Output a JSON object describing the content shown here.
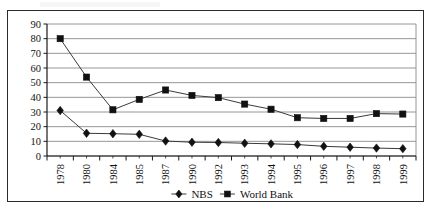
{
  "chart_data": {
    "type": "line",
    "title": "",
    "subtitle": "",
    "xlabel": "",
    "ylabel": "",
    "categories": [
      "1978",
      "1980",
      "1984",
      "1985",
      "1987",
      "1990",
      "1992",
      "1993",
      "1994",
      "1995",
      "1996",
      "1997",
      "1998",
      "1999"
    ],
    "series": [
      {
        "name": "NBS",
        "marker": "diamond",
        "color": "#000000",
        "values": [
          31,
          15.5,
          15.2,
          14.8,
          10.2,
          9.4,
          9.2,
          8.7,
          8.3,
          7.8,
          6.6,
          6.0,
          5.4,
          5.0
        ]
      },
      {
        "name": "World Bank",
        "marker": "square",
        "color": "#000000",
        "values": [
          80,
          53.8,
          31.5,
          38.6,
          45,
          41.3,
          39.8,
          35.4,
          31.9,
          26.1,
          25.6,
          25.6,
          28.9,
          28.6
        ]
      }
    ],
    "ylim": [
      0,
      90
    ],
    "ytick_step": 10,
    "yticks": [
      "0",
      "10",
      "20",
      "30",
      "40",
      "50",
      "60",
      "70",
      "80",
      "90"
    ],
    "grid": "horizontal",
    "legend_position": "bottom",
    "legend": [
      {
        "label": "NBS",
        "marker": "diamond"
      },
      {
        "label": "World Bank",
        "marker": "square"
      }
    ]
  },
  "style": {
    "grid_color": "#8a8a8a",
    "axis_color": "#1a1a1a",
    "line_color": "#3a3a3a",
    "marker_color": "#111111",
    "frame_color": "#2b2b2b",
    "background": "#ffffff"
  }
}
